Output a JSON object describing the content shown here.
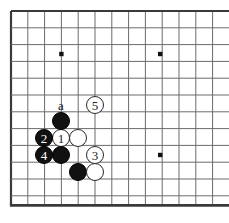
{
  "diagram": {
    "kind": "go-board-joseki-diagram",
    "board": {
      "origin_x": 11,
      "origin_y": 11,
      "spacing": 16.8,
      "cols": 13,
      "rows": 12,
      "line_color": "#6b6b6b",
      "edge_color": "#3a3a3a",
      "background": "#ffffff",
      "star_points": [
        {
          "col": 3,
          "row": 2.56
        },
        {
          "col": 8.88,
          "row": 2.56
        },
        {
          "col": 8.88,
          "row": 8.57
        }
      ]
    },
    "stones": [
      {
        "id": "w1",
        "color": "white",
        "label": "1",
        "col": 3,
        "row": 7.56,
        "x": 61,
        "y": 138
      },
      {
        "id": "b2",
        "color": "black",
        "label": "2",
        "col": 2,
        "row": 7.56,
        "x": 44,
        "y": 138
      },
      {
        "id": "w3",
        "color": "white",
        "label": "3",
        "col": 5,
        "row": 8.57,
        "x": 95,
        "y": 155
      },
      {
        "id": "b4",
        "color": "black",
        "label": "4",
        "col": 2,
        "row": 8.57,
        "x": 44,
        "y": 155
      },
      {
        "id": "w5",
        "color": "white",
        "label": "5",
        "col": 5,
        "row": 5.57,
        "x": 95,
        "y": 105
      },
      {
        "id": "b6",
        "color": "black",
        "label": "",
        "col": 3,
        "row": 6.56,
        "x": 61,
        "y": 121
      },
      {
        "id": "w7",
        "color": "white",
        "label": "",
        "col": 4,
        "row": 7.56,
        "x": 78,
        "y": 138
      },
      {
        "id": "b8",
        "color": "black",
        "label": "",
        "col": 3,
        "row": 8.57,
        "x": 61,
        "y": 155
      },
      {
        "id": "b9",
        "color": "black",
        "label": "",
        "col": 4,
        "row": 9.58,
        "x": 78,
        "y": 172
      },
      {
        "id": "w10",
        "color": "white",
        "label": "",
        "col": 5,
        "row": 9.58,
        "x": 95,
        "y": 172
      }
    ],
    "point_labels": [
      {
        "id": "pa",
        "text": "a",
        "x": 61,
        "y": 105
      }
    ],
    "stone_radius": 9.2,
    "stone_label_size": "13px",
    "coord_label_size": "13px"
  }
}
